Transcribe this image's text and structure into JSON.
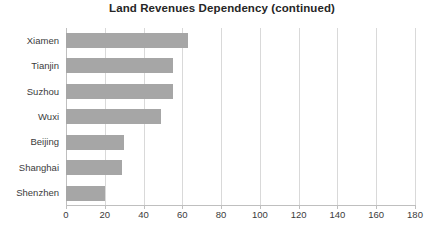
{
  "chart_data": {
    "type": "bar",
    "orientation": "horizontal",
    "title": "Land Revenues Dependency (continued)",
    "subtitle": "",
    "xlabel": "",
    "ylabel": "",
    "categories": [
      "Xiamen",
      "Tianjin",
      "Suzhou",
      "Wuxi",
      "Beijing",
      "Shanghai",
      "Shenzhen"
    ],
    "values": [
      63,
      55,
      55,
      49,
      30,
      29,
      20
    ],
    "series": [
      {
        "name": "Land Revenues Dependency",
        "values": [
          63,
          55,
          55,
          49,
          30,
          29,
          20
        ],
        "color": "#a6a6a6"
      }
    ],
    "xlim": [
      0,
      180
    ],
    "xticks": [
      0,
      20,
      40,
      60,
      80,
      100,
      120,
      140,
      160,
      180
    ],
    "xtick_labels": [
      "0",
      "20",
      "40",
      "60",
      "80",
      "100",
      "120",
      "140",
      "160",
      "180"
    ],
    "grid": "vertical",
    "legend": "none",
    "annotations": []
  },
  "style": {
    "bar_color": "#a6a6a6",
    "gridline_color": "#d9d9d9",
    "axis_color": "#bfbfbf",
    "text_color": "#3b3b3b",
    "title_color": "#262626",
    "background": "#ffffff"
  }
}
